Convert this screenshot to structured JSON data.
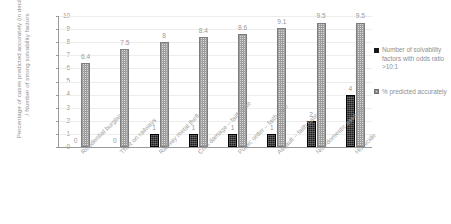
{
  "chart_data": {
    "type": "bar",
    "title": "",
    "xlabel": "",
    "ylabel": "Percentage of cases predicted accurately (in deciles) / Number of strong solvability factors",
    "ylim": [
      0,
      10
    ],
    "ytick_labels": [
      "10",
      "9",
      "8",
      "7",
      "6",
      "5",
      "4",
      "3",
      "2",
      "1",
      "0"
    ],
    "grid": true,
    "legend_position": "right",
    "categories": [
      "Residential burglary",
      "Theft on railways",
      "Railway metal theft",
      "Crim damage – faith hate",
      "Public order – faith hate",
      "Assault – faith hate",
      "Non-domestic assaults",
      "Homicide"
    ],
    "series": [
      {
        "name": "Number of solvability factors with odds ratio >10:1",
        "color": "#1c1c1c",
        "values": [
          0,
          0,
          1,
          1,
          1,
          1,
          2,
          4
        ],
        "labels": [
          "0",
          "0",
          "1",
          "1",
          "1",
          "1",
          "2",
          "4"
        ]
      },
      {
        "name": "% predicted accurately",
        "color": "#d9d9d9",
        "values": [
          6.4,
          7.5,
          8,
          8.4,
          8.6,
          9.1,
          9.5,
          9.5
        ],
        "labels": [
          "6.4",
          "7.5",
          "8",
          "8.4",
          "8.6",
          "9.1",
          "9.5",
          "9.5"
        ]
      }
    ]
  },
  "legend": {
    "items": [
      {
        "label": "Number of solvability factors with odds ratio >10:1",
        "swatch": "dark-square-icon"
      },
      {
        "label": "% predicted accurately",
        "swatch": "pattern-square-icon"
      }
    ]
  }
}
